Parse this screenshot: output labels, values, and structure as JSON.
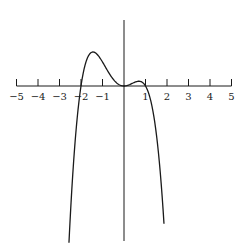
{
  "chart_data": {
    "type": "line",
    "title": "",
    "xlabel": "",
    "ylabel": "",
    "function": "-x^2 (x+2)(x-1)",
    "xlim": [
      -5,
      5
    ],
    "x_ticks": [
      -5,
      -4,
      -3,
      -2,
      -1,
      0,
      1,
      2,
      3,
      4,
      5
    ],
    "x_tick_labels": [
      "−5",
      "−4",
      "−3",
      "−2",
      "−1",
      "",
      "1",
      "2",
      "3",
      "4",
      "5"
    ],
    "roots": [
      -2,
      0,
      1
    ],
    "local_max": [
      {
        "x": -1.44,
        "y": 2.83
      },
      {
        "x": 0.69,
        "y": 0.39
      }
    ],
    "domain_plotted": [
      -2.56,
      1.86
    ],
    "grid": false,
    "legend": null,
    "series": [
      {
        "name": "f(x)",
        "x": [
          -2.56,
          -2.4,
          -2.2,
          -2.0,
          -1.8,
          -1.6,
          -1.44,
          -1.2,
          -1.0,
          -0.8,
          -0.6,
          -0.4,
          -0.2,
          0.0,
          0.2,
          0.4,
          0.6,
          0.69,
          0.8,
          1.0,
          1.2,
          1.4,
          1.6,
          1.86
        ],
        "y": [
          -13.0,
          -7.83,
          -3.1,
          0.0,
          1.81,
          2.66,
          2.83,
          2.59,
          2.0,
          1.28,
          0.65,
          0.23,
          0.04,
          0.0,
          0.04,
          0.21,
          0.37,
          0.39,
          0.36,
          0.0,
          -0.72,
          -1.96,
          -3.64,
          -11.48
        ]
      }
    ],
    "color": "#1a1a1a"
  }
}
